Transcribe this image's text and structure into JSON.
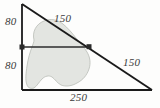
{
  "figure": {
    "kind": "right-triangle-with-shaded-region",
    "background_color": "#fdfdfc",
    "stroke_color": "#1a1a1a",
    "blob_fill_color": "#e3e5e1",
    "blob_stroke_color": "#b9bcb6",
    "midline_color": "#2b2b2b",
    "labels": {
      "left_upper": "80",
      "left_lower": "80",
      "hypotenuse_upper": "150",
      "hypotenuse_lower": "150",
      "base": "250"
    },
    "geometry": {
      "apex": [
        22,
        4
      ],
      "bottom_left": [
        22,
        90
      ],
      "bottom_right": [
        152,
        90
      ],
      "midline_left": [
        22,
        47
      ],
      "midline_right": [
        89,
        47
      ],
      "vertical_leg_total": 160,
      "horizontal_leg": 250,
      "hypotenuse_total": 300
    }
  }
}
